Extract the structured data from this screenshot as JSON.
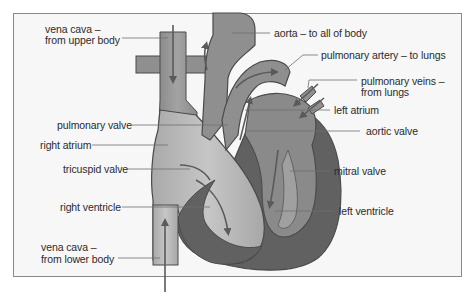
{
  "diagram": {
    "type": "labeled anatomical diagram",
    "colors": {
      "frame_border": "#8a8a8a",
      "background": "#f7f7f7",
      "light_chamber": "#b9b9b9",
      "mid_vessel": "#8f8f8f",
      "dark_muscle": "#616161",
      "outline": "#4a4a4a",
      "leader_line": "#6e6e6e",
      "text": "#2b2b2b"
    }
  },
  "labels": {
    "vena_cava_upper_1": "vena cava –",
    "vena_cava_upper_2": "from upper body",
    "aorta": "aorta – to all of body",
    "pulmonary_artery": "pulmonary artery – to lungs",
    "pulmonary_veins_1": "pulmonary veins –",
    "pulmonary_veins_2": "from lungs",
    "left_atrium": "left atrium",
    "pulmonary_valve": "pulmonary valve",
    "aortic_valve": "aortic valve",
    "right_atrium": "right atrium",
    "tricuspid_valve": "tricuspid valve",
    "mitral_valve": "mitral valve",
    "right_ventricle": "right ventricle",
    "left_ventricle": "left ventricle",
    "vena_cava_lower_1": "vena cava –",
    "vena_cava_lower_2": "from lower body"
  }
}
